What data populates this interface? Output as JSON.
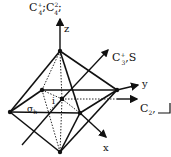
{
  "labels": {
    "title_c4": "C",
    "title_c4_sup1": "+",
    "title_c4_sub1": "4",
    "title_sep1": ";C",
    "title_c4_sup2": "2",
    "title_c4_sub2": "4",
    "title_sep2": ";",
    "z": "z",
    "y": "y",
    "x": "x",
    "c3_main": "C",
    "c3_sup": "+",
    "c3_sub": "3",
    "c3_tail": ",S",
    "c2_main": "C",
    "c2_sub": "2",
    "c2_tail": ",",
    "sigma": "σ",
    "sigma_sub": "h",
    "inversion": "i"
  },
  "colors": {
    "line": "#111111",
    "background": "#ffffff"
  }
}
